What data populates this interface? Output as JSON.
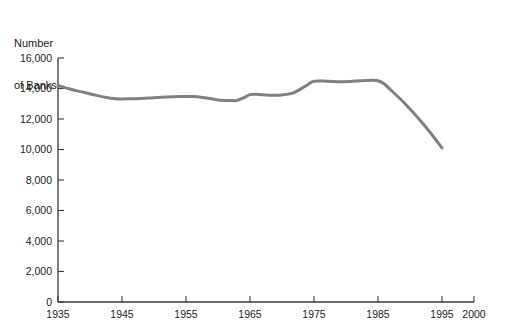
{
  "chart_data": {
    "type": "line",
    "title": "",
    "ylabel": "Number of Banks",
    "ylabel_lines": [
      "Number",
      "of Banks"
    ],
    "xlabel": "",
    "xlim": [
      1935,
      2000
    ],
    "ylim": [
      0,
      16000
    ],
    "grid": false,
    "legend": false,
    "line_color": "#808080",
    "axis_color": "#3b3b3b",
    "background_color": "#ffffff",
    "x_ticks": [
      1935,
      1945,
      1955,
      1965,
      1975,
      1985,
      1995,
      2000
    ],
    "x_tick_labels": [
      "1935",
      "1945",
      "1955",
      "1965",
      "1975",
      "1985",
      "1995",
      "2000"
    ],
    "y_ticks": [
      0,
      2000,
      4000,
      6000,
      8000,
      10000,
      12000,
      14000,
      16000
    ],
    "y_tick_labels": [
      "0",
      "2,000",
      "4,000",
      "6,000",
      "8,000",
      "10,000",
      "12,000",
      "14,000",
      "16,000"
    ],
    "series": [
      {
        "name": "Number of Banks",
        "color": "#808080",
        "x": [
          1935,
          1937,
          1939,
          1941,
          1943,
          1944,
          1946,
          1948,
          1950,
          1952,
          1954,
          1956,
          1957,
          1959,
          1960,
          1962,
          1963,
          1964,
          1965,
          1966,
          1968,
          1970,
          1972,
          1974,
          1975,
          1977,
          1979,
          1981,
          1983,
          1984,
          1985,
          1986,
          1987,
          1989,
          1991,
          1993,
          1995
        ],
        "values": [
          14200,
          13950,
          13750,
          13550,
          13380,
          13320,
          13320,
          13350,
          13400,
          13440,
          13470,
          13480,
          13450,
          13330,
          13250,
          13210,
          13220,
          13380,
          13600,
          13620,
          13560,
          13580,
          13750,
          14250,
          14470,
          14480,
          14440,
          14470,
          14520,
          14540,
          14510,
          14300,
          13900,
          13100,
          12200,
          11200,
          10100
        ]
      }
    ]
  }
}
